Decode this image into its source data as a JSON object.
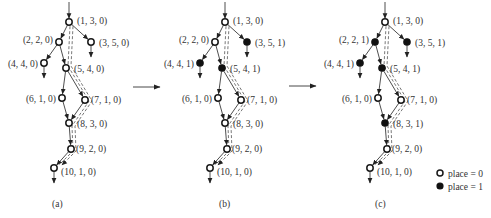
{
  "figure": {
    "panels": [
      {
        "label": "(a)",
        "nodes": [
          {
            "id": 1,
            "text": "(1, 3, 0)",
            "place": 0
          },
          {
            "id": 2,
            "text": "(2, 2, 0)",
            "place": 0
          },
          {
            "id": 3,
            "text": "(3, 5, 0)",
            "place": 0
          },
          {
            "id": 4,
            "text": "(4, 4, 0)",
            "place": 0
          },
          {
            "id": 5,
            "text": "(5, 4, 0)",
            "place": 0
          },
          {
            "id": 6,
            "text": "(6, 1, 0)",
            "place": 0
          },
          {
            "id": 7,
            "text": "(7, 1, 0)",
            "place": 0
          },
          {
            "id": 8,
            "text": "(8, 3, 0)",
            "place": 0
          },
          {
            "id": 9,
            "text": "(9, 2, 0)",
            "place": 0
          },
          {
            "id": 10,
            "text": "(10, 1, 0)",
            "place": 0
          }
        ]
      },
      {
        "label": "(b)",
        "nodes": [
          {
            "id": 1,
            "text": "(1, 3, 0)",
            "place": 0
          },
          {
            "id": 2,
            "text": "(2, 2, 0)",
            "place": 0
          },
          {
            "id": 3,
            "text": "(3, 5, 1)",
            "place": 1
          },
          {
            "id": 4,
            "text": "(4, 4, 1)",
            "place": 1
          },
          {
            "id": 5,
            "text": "(5, 4, 1)",
            "place": 1
          },
          {
            "id": 6,
            "text": "(6, 1, 0)",
            "place": 0
          },
          {
            "id": 7,
            "text": "(7, 1, 0)",
            "place": 0
          },
          {
            "id": 8,
            "text": "(8, 3, 0)",
            "place": 0
          },
          {
            "id": 9,
            "text": "(9, 2, 0)",
            "place": 0
          },
          {
            "id": 10,
            "text": "(10, 1, 0)",
            "place": 0
          }
        ]
      },
      {
        "label": "(c)",
        "nodes": [
          {
            "id": 1,
            "text": "(1, 3, 0)",
            "place": 0
          },
          {
            "id": 2,
            "text": "(2, 2, 1)",
            "place": 1
          },
          {
            "id": 3,
            "text": "(3, 5, 1)",
            "place": 1
          },
          {
            "id": 4,
            "text": "(4, 4, 1)",
            "place": 1
          },
          {
            "id": 5,
            "text": "(5, 4, 1)",
            "place": 1
          },
          {
            "id": 6,
            "text": "(6, 1, 0)",
            "place": 0
          },
          {
            "id": 7,
            "text": "(7, 1, 0)",
            "place": 0
          },
          {
            "id": 8,
            "text": "(8, 3, 1)",
            "place": 1
          },
          {
            "id": 9,
            "text": "(9, 2, 0)",
            "place": 0
          },
          {
            "id": 10,
            "text": "(10, 1, 0)",
            "place": 0
          }
        ]
      }
    ],
    "edges": [
      [
        1,
        2
      ],
      [
        1,
        3
      ],
      [
        2,
        4
      ],
      [
        2,
        5
      ],
      [
        5,
        6
      ],
      [
        5,
        7
      ],
      [
        6,
        8
      ],
      [
        7,
        8
      ],
      [
        8,
        9
      ],
      [
        9,
        10
      ]
    ],
    "legend": {
      "open": "place = 0",
      "filled": "place = 1"
    }
  }
}
